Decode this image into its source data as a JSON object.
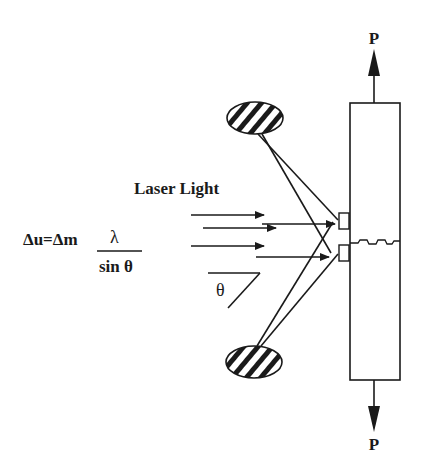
{
  "diagram": {
    "labels": {
      "load_top": "P",
      "load_bottom": "P",
      "laser": "Laser Light",
      "formula_lhs": "Δu=Δm",
      "formula_numerator": "λ",
      "formula_denominator": "sin θ",
      "angle": "θ"
    },
    "components": [
      {
        "id": "specimen",
        "type": "rectangle",
        "description": "Specimen under tensile load P"
      },
      {
        "id": "crack",
        "type": "wavy-line",
        "description": "Crack across specimen"
      },
      {
        "id": "gauge-indent-upper",
        "type": "reflector pad"
      },
      {
        "id": "gauge-indent-lower",
        "type": "reflector pad"
      },
      {
        "id": "detector-top",
        "type": "hatched ellipse",
        "description": "Fringe pattern screen / photodetector"
      },
      {
        "id": "detector-bottom",
        "type": "hatched ellipse",
        "description": "Fringe pattern screen / photodetector"
      },
      {
        "id": "laser-beams",
        "type": "arrows",
        "count": 5
      }
    ],
    "colors": {
      "ink": "#1a1a1a",
      "background": "#ffffff"
    }
  }
}
